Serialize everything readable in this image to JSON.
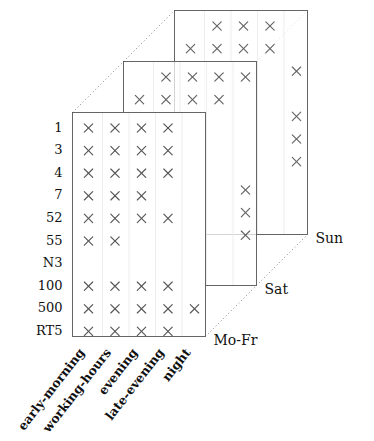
{
  "chart_data": {
    "type": "scatter",
    "title": "",
    "xlabel": "",
    "ylabel": "",
    "zlabel": "",
    "grid": false,
    "legend_position": "none",
    "categories": [
      "early-morning",
      "working-hours",
      "evening",
      "late-evening",
      "night"
    ],
    "rows": [
      "1",
      "3",
      "4",
      "7",
      "52",
      "55",
      "N3",
      "100",
      "500",
      "RT5"
    ],
    "depth_levels": [
      "Mo-Fr",
      "Sat",
      "Sun"
    ],
    "marker": "x",
    "marker_color": "#555555",
    "series": [
      {
        "name": "Mo-Fr",
        "points": [
          {
            "row": "1",
            "columns": [
              "early-morning",
              "working-hours",
              "evening",
              "late-evening"
            ]
          },
          {
            "row": "3",
            "columns": [
              "early-morning",
              "working-hours",
              "evening",
              "late-evening"
            ]
          },
          {
            "row": "4",
            "columns": [
              "early-morning",
              "working-hours",
              "evening",
              "late-evening"
            ]
          },
          {
            "row": "7",
            "columns": [
              "early-morning",
              "working-hours",
              "evening"
            ]
          },
          {
            "row": "52",
            "columns": [
              "early-morning",
              "working-hours",
              "evening",
              "late-evening"
            ]
          },
          {
            "row": "55",
            "columns": [
              "early-morning",
              "working-hours"
            ]
          },
          {
            "row": "N3",
            "columns": []
          },
          {
            "row": "100",
            "columns": [
              "early-morning",
              "working-hours",
              "evening",
              "late-evening"
            ]
          },
          {
            "row": "500",
            "columns": [
              "early-morning",
              "working-hours",
              "evening",
              "late-evening",
              "night"
            ]
          },
          {
            "row": "RT5",
            "columns": [
              "early-morning",
              "working-hours",
              "evening",
              "late-evening"
            ]
          }
        ]
      },
      {
        "name": "Sat",
        "points": [
          {
            "row": "1",
            "columns": [
              "working-hours",
              "evening",
              "late-evening",
              "night"
            ]
          },
          {
            "row": "3",
            "columns": [
              "early-morning",
              "working-hours",
              "evening",
              "late-evening"
            ]
          },
          {
            "row": "4",
            "columns": [
              "early-morning",
              "working-hours"
            ]
          },
          {
            "row": "7",
            "columns": [
              "early-morning",
              "working-hours"
            ]
          },
          {
            "row": "52",
            "columns": [
              "early-morning"
            ]
          },
          {
            "row": "55",
            "columns": [
              "early-morning",
              "working-hours",
              "night"
            ]
          },
          {
            "row": "N3",
            "columns": [
              "night"
            ]
          },
          {
            "row": "100",
            "columns": [
              "night"
            ]
          },
          {
            "row": "500",
            "columns": []
          },
          {
            "row": "RT5",
            "columns": [
              "early-morning",
              "working-hours"
            ]
          }
        ]
      },
      {
        "name": "Sun",
        "points": [
          {
            "row": "1",
            "columns": [
              "working-hours",
              "evening",
              "late-evening"
            ]
          },
          {
            "row": "3",
            "columns": [
              "early-morning",
              "working-hours",
              "evening",
              "late-evening"
            ]
          },
          {
            "row": "4",
            "columns": [
              "night"
            ]
          },
          {
            "row": "7",
            "columns": []
          },
          {
            "row": "52",
            "columns": [
              "night"
            ]
          },
          {
            "row": "55",
            "columns": [
              "night"
            ]
          },
          {
            "row": "N3",
            "columns": [
              "night"
            ]
          },
          {
            "row": "100",
            "columns": []
          },
          {
            "row": "500",
            "columns": []
          },
          {
            "row": "RT5",
            "columns": []
          }
        ]
      }
    ]
  },
  "axes": {
    "y_tick_labels": [
      "1",
      "3",
      "4",
      "7",
      "52",
      "55",
      "N3",
      "100",
      "500",
      "RT5"
    ],
    "x_tick_labels": [
      "early-morning",
      "working-hours",
      "evening",
      "late-evening",
      "night"
    ],
    "depth_tick_labels": [
      "Mo-Fr",
      "Sat",
      "Sun"
    ]
  }
}
